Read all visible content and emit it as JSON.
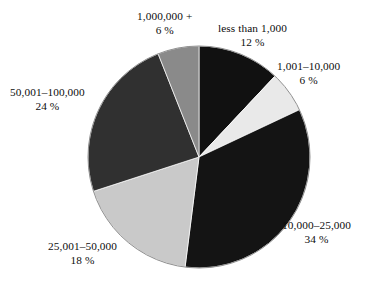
{
  "chart_data": {
    "type": "pie",
    "title": "",
    "subtitle": "",
    "xlabel": "",
    "ylabel": "",
    "legend_position": "none",
    "grid": false,
    "labels_outside": true,
    "total_percent": 100,
    "categories": [
      "less than 1,000",
      "1,001–10,000",
      "10,000–25,000",
      "25,001–50,000",
      "50,001–100,000",
      "1,000,000 +"
    ],
    "values": [
      12,
      6,
      34,
      18,
      24,
      6
    ],
    "value_labels": [
      "12 %",
      "6 %",
      "34 %",
      "18 %",
      "24 %",
      "6 %"
    ],
    "colors": [
      "#111111",
      "#e9e9e9",
      "#141414",
      "#c9c9c9",
      "#303030",
      "#8a8a8a"
    ],
    "start_angle_deg": 0,
    "direction": "clockwise",
    "slices": [
      {
        "category": "less than 1,000",
        "value": 12,
        "value_label": "12 %",
        "color": "#111111"
      },
      {
        "category": "1,001–10,000",
        "value": 6,
        "value_label": "6 %",
        "color": "#e9e9e9"
      },
      {
        "category": "10,000–25,000",
        "value": 34,
        "value_label": "34 %",
        "color": "#141414"
      },
      {
        "category": "25,001–50,000",
        "value": 18,
        "value_label": "18 %",
        "color": "#c9c9c9"
      },
      {
        "category": "50,001–100,000",
        "value": 24,
        "value_label": "24 %",
        "color": "#303030"
      },
      {
        "category": "1,000,000 +",
        "value": 6,
        "value_label": "6 %",
        "color": "#8a8a8a"
      }
    ]
  },
  "figure": {
    "background": "#ffffff",
    "outline_color": "#8f8f8f",
    "center_x": 199,
    "center_y": 157,
    "radius": 111
  }
}
